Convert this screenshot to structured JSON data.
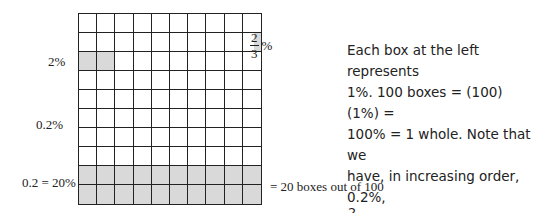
{
  "diagram": {
    "type": "percent-grid",
    "rows": 10,
    "cols": 10,
    "shading": {
      "two_thirds_percent": {
        "row": 2,
        "col": 10,
        "fraction": "partial"
      },
      "two_percent": {
        "row": 3,
        "cols": [
          1,
          2
        ]
      },
      "twenty_percent": {
        "rows": [
          9,
          10
        ]
      }
    },
    "shade_color": "#d9d9d9",
    "line_color": "#222222"
  },
  "labels": {
    "two_thirds": {
      "numerator": "2",
      "denominator": "3",
      "suffix": "%"
    },
    "two_percent": "2%",
    "point_two_percent": "0.2%",
    "twenty_percent": "0.2 = 20%",
    "twenty_boxes": "= 20 boxes out of 100"
  },
  "description": {
    "line1": "Each box at the left represents",
    "line2": "1%. 100 boxes = (100)(1%) =",
    "line3": "100% = 1 whole. Note that we",
    "line4": "have, in increasing order, 0.2%,",
    "frac_num": "2",
    "frac_den": "3",
    "line5_rest": "%, 2%, and 20%."
  }
}
